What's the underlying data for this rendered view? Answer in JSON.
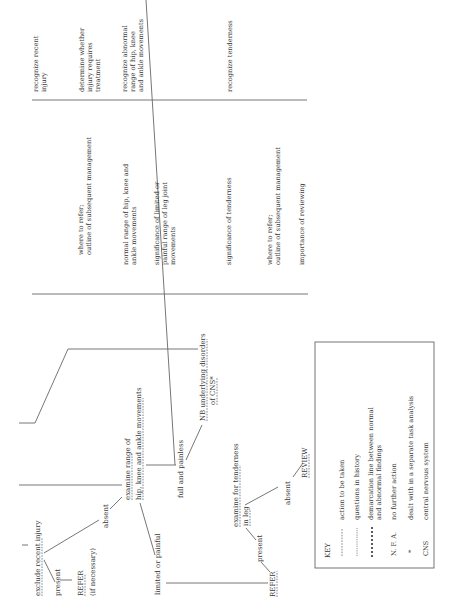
{
  "flowchart": {
    "exclude_recent_injury": "exclude recent injury",
    "present_1": "present",
    "refer_1": "REFER",
    "refer_1_note": "(if necessary)",
    "absent_1": "absent",
    "examine_range_line1": "examine range of",
    "examine_range_line2": "hip, knee and ankle movements",
    "limited_or_painful": "limited or painful",
    "full_and_painless": "full and painless",
    "nb_line1": "NB underlying disorders",
    "nb_line2": "of CNS*",
    "examine_tenderness_line1": "examine for tenderness",
    "examine_tenderness_line2": "in leg",
    "present_2": "present",
    "absent_2": "absent",
    "refer_2": "REFER",
    "review": "REVIEW"
  },
  "knowledge_column": {
    "items": [
      {
        "lines": [
          "where to refer;",
          "outline of subsequent management"
        ]
      },
      {
        "lines": [
          "normal range of hip, knee and",
          "ankle movements"
        ]
      },
      {
        "lines": [
          "significance of limited or",
          "painful range of leg joint",
          "movements"
        ]
      },
      {
        "lines": [
          "significance of tenderness"
        ]
      },
      {
        "lines": [
          "where to refer;",
          "outline of subsequent management"
        ]
      },
      {
        "lines": [
          "importance of reviewing"
        ]
      }
    ]
  },
  "skills_column": {
    "items": [
      {
        "lines": [
          "recognize recent",
          "injury"
        ]
      },
      {
        "lines": [
          "determine whether",
          "injury requires",
          "treatment"
        ]
      },
      {
        "lines": [
          "recognize abnormal",
          "range of hip, knee",
          "and ankle movements"
        ]
      },
      {
        "lines": [
          "recognize tenderness"
        ]
      }
    ]
  },
  "key": {
    "title": "KEY",
    "entries": [
      {
        "symbol": "dashed-line",
        "label": "action to be taken"
      },
      {
        "symbol": "dotted-line",
        "label": "questions in history"
      },
      {
        "symbol": "bold-dots",
        "label_line1": "demarcation line between normal",
        "label_line2": "and abnormal findings"
      },
      {
        "symbol_text": "N. F. A.",
        "label": "no further action"
      },
      {
        "symbol_text": "*",
        "label": "dealt with in a separate task analysis"
      },
      {
        "symbol_text": "CNS",
        "label": "central nervous system"
      }
    ]
  }
}
